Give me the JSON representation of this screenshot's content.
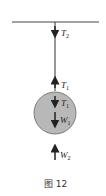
{
  "figure": {
    "caption": "图 12",
    "colors": {
      "line": "#333333",
      "ball_fill": "#b8b8b8",
      "ball_stroke": "#555555"
    },
    "forces": [
      {
        "id": "T2",
        "symbol": "T",
        "subscript": "2",
        "direction": "down",
        "location": "top of rope at ceiling"
      },
      {
        "id": "T1_rope",
        "symbol": "T",
        "subscript": "1",
        "direction": "up",
        "location": "bottom of rope"
      },
      {
        "id": "T1_ball",
        "symbol": "T",
        "subscript": "1",
        "direction": "down",
        "location": "on ball"
      },
      {
        "id": "W1",
        "symbol": "W",
        "subscript": "1",
        "direction": "down",
        "location": "on ball"
      },
      {
        "id": "W2",
        "symbol": "W",
        "subscript": "2",
        "direction": "up",
        "location": "below ball"
      }
    ]
  }
}
